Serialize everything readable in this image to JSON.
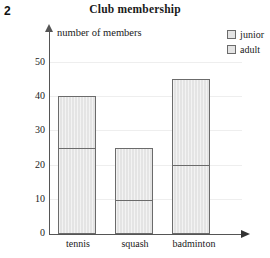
{
  "question_number": "2",
  "title": "Club membership",
  "axis_label": "number of members",
  "legend": {
    "items": [
      {
        "label": "junior",
        "color": "#e4e4e4",
        "border": "#6b6b6b"
      },
      {
        "label": "adult",
        "color": "#e4e4e4",
        "border": "#6b6b6b"
      }
    ]
  },
  "axis": {
    "y_ticks": [
      "0",
      "10",
      "20",
      "30",
      "40",
      "50"
    ],
    "x_categories": [
      "tennis",
      "squash",
      "badminton"
    ]
  },
  "chart_data": {
    "type": "bar",
    "stacked": true,
    "title": "Club membership",
    "xlabel": "",
    "ylabel": "number of members",
    "ylim": [
      0,
      50
    ],
    "yticks": [
      0,
      10,
      20,
      30,
      40,
      50
    ],
    "grid": false,
    "legend_position": "top-right",
    "categories": [
      "tennis",
      "squash",
      "badminton"
    ],
    "series": [
      {
        "name": "adult",
        "values": [
          25,
          10,
          20
        ]
      },
      {
        "name": "junior",
        "values": [
          15,
          15,
          25
        ]
      }
    ],
    "totals": [
      40,
      25,
      45
    ],
    "segment_boundaries": [
      25,
      10,
      20
    ],
    "annotations": []
  }
}
